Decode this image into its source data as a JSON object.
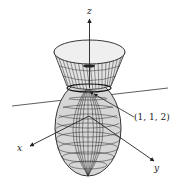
{
  "figure": {
    "axes": {
      "x_label": "x",
      "y_label": "y",
      "z_label": "z"
    },
    "point_label": "(1, 1, 2)",
    "surfaces": [
      "upper-cone-bowl",
      "lower-ellipsoid"
    ],
    "colors": {
      "surface_fill": "#d9d9d9",
      "rim_fill": "#eeeeee",
      "mesh_line": "#333333",
      "axis_line": "#222222"
    }
  }
}
